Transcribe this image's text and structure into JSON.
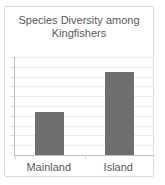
{
  "chart_data": {
    "type": "bar",
    "title": "Species Diversity among Kingfishers",
    "title_lines": [
      "Species Diversity among",
      "Kingfishers"
    ],
    "categories": [
      "Mainland",
      "Island"
    ],
    "values": [
      4.4,
      8.5
    ],
    "xlabel": "",
    "ylabel": "",
    "ylim": [
      0,
      10
    ],
    "gridline_interval": 1,
    "grid": "horizontal",
    "legend": "none",
    "y_tick_labels_shown": false,
    "colors": {
      "bar": "#6f6f6f",
      "axis": "#bfbfbf",
      "gridline": "#ececec",
      "tick": "#d9d9d9",
      "text": "#595959",
      "card_border": "#d9d9d9",
      "background": "#ffffff"
    }
  }
}
